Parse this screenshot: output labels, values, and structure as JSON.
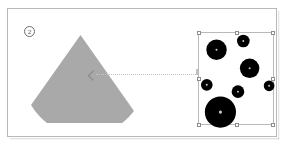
{
  "slide": {
    "background_color": "#ffffff",
    "frame_border_color": "#b8b8b8"
  },
  "step_badge": {
    "label": "2",
    "text_color": "#4a4a4a",
    "border_color": "#6e6e6e"
  },
  "cone": {
    "name": "gray-cone-wedge",
    "fill_color": "#a9a9a9",
    "chevron_mark": "<",
    "chevron_color": "#8a8a8a"
  },
  "connector": {
    "style": "dotted",
    "color": "#c2c2c2"
  },
  "selection": {
    "border_color": "#b9b9b9",
    "handle_fill": "#ffffff",
    "handle_border": "#8d8d8d",
    "handle_count": 8,
    "handles": [
      {
        "name": "handle-top-left",
        "x": 0,
        "y": 0
      },
      {
        "name": "handle-top-center",
        "x": 50,
        "y": 0
      },
      {
        "name": "handle-top-right",
        "x": 100,
        "y": 0
      },
      {
        "name": "handle-middle-left",
        "x": 0,
        "y": 50
      },
      {
        "name": "handle-middle-right",
        "x": 100,
        "y": 50
      },
      {
        "name": "handle-bottom-left",
        "x": 0,
        "y": 100
      },
      {
        "name": "handle-bottom-center",
        "x": 50,
        "y": 100
      },
      {
        "name": "handle-bottom-right",
        "x": 100,
        "y": 100
      }
    ]
  },
  "chart_data": {
    "type": "scatter",
    "title": "",
    "xlabel": "",
    "ylabel": "",
    "marker_color": "#000000",
    "xlim": [
      0,
      76
    ],
    "ylim": [
      0,
      93
    ],
    "grid": false,
    "legend": "none",
    "note": "Black filled circles of varying radius arranged inside the selected bounding box.",
    "points": [
      {
        "name": "circle-1",
        "x": 18,
        "y": 17,
        "r": 10.5
      },
      {
        "name": "circle-2",
        "x": 45.5,
        "y": 8,
        "r": 6.5
      },
      {
        "name": "circle-3",
        "x": 52,
        "y": 36,
        "r": 10
      },
      {
        "name": "circle-4",
        "x": 8,
        "y": 53,
        "r": 6
      },
      {
        "name": "circle-5",
        "x": 72,
        "y": 54,
        "r": 5.5
      },
      {
        "name": "circle-6",
        "x": 40,
        "y": 60,
        "r": 6.5
      },
      {
        "name": "circle-7",
        "x": 22,
        "y": 81,
        "r": 16
      }
    ]
  }
}
